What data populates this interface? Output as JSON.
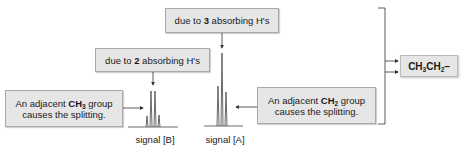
{
  "boxes": {
    "three_h": {
      "prefix": "due to ",
      "bold": "3",
      "suffix": " absorbing H's"
    },
    "two_h": {
      "prefix": "due to ",
      "bold": "2",
      "suffix": " absorbing H's"
    },
    "ch3_split": {
      "line1_prefix": "An adjacent ",
      "bold": "CH",
      "sub": "3",
      "line1_suffix": " group",
      "line2": "causes the splitting."
    },
    "ch2_split": {
      "line1_prefix": "An adjacent ",
      "bold": "CH",
      "sub": "2",
      "line1_suffix": " group",
      "line2": "causes the splitting."
    }
  },
  "signals": {
    "b": {
      "label": "signal [B]",
      "pattern": "quartet"
    },
    "a": {
      "label": "signal [A]",
      "pattern": "triplet"
    }
  },
  "result": {
    "p1": "CH",
    "s1": "3",
    "p2": "CH",
    "s2": "2",
    "tail": "–"
  },
  "colors": {
    "box_fill": "#e6e6e6",
    "box_border": "#a9a9a9",
    "line": "#333333"
  }
}
